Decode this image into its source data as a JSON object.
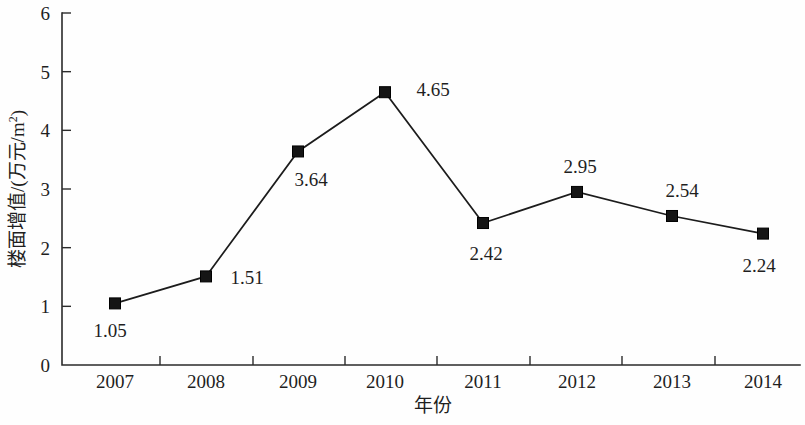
{
  "chart_data": {
    "type": "line",
    "title": "",
    "subtitle": "",
    "xlabel": "年份",
    "ylabel": "楼面增值/(万元/m²)",
    "ylabel_main": "楼面增值/(万元/m",
    "ylabel_sup": "2",
    "ylabel_tail": ")",
    "categories": [
      "2007",
      "2008",
      "2009",
      "2010",
      "2011",
      "2012",
      "2013",
      "2014"
    ],
    "values": [
      1.05,
      1.51,
      3.64,
      4.65,
      2.42,
      2.95,
      2.54,
      2.24
    ],
    "point_labels": [
      "1.05",
      "1.51",
      "3.64",
      "4.65",
      "2.42",
      "2.95",
      "2.54",
      "2.24"
    ],
    "ylim": [
      0,
      6
    ],
    "ytick_labels": [
      "0",
      "1",
      "2",
      "3",
      "4",
      "5",
      "6"
    ],
    "ytick_values": [
      0,
      1,
      2,
      3,
      4,
      5,
      6
    ],
    "grid": false,
    "legend": false,
    "legend_position": "none",
    "marker": "square",
    "series": [
      {
        "name": "楼面增值",
        "values": [
          1.05,
          1.51,
          3.64,
          4.65,
          2.42,
          2.95,
          2.54,
          2.24
        ]
      }
    ],
    "colors": {
      "line": "#1c1c1c",
      "marker": "#151515",
      "axis": "#2b2b2b",
      "text": "#1f1f1f",
      "background": "#fefefe"
    }
  },
  "layout": {
    "plot_left": 62,
    "plot_right": 800,
    "plot_top": 13,
    "plot_bottom": 365,
    "point_x": [
      115,
      206,
      298,
      385,
      483,
      577,
      672,
      763
    ],
    "tick_x": [
      160,
      253,
      345,
      437,
      530,
      622,
      715
    ],
    "label_offsets": [
      {
        "dx": -5,
        "dy": 34
      },
      {
        "dx": 41,
        "dy": 8
      },
      {
        "dx": 13,
        "dy": 35
      },
      {
        "dx": 48,
        "dy": 4
      },
      {
        "dx": 3,
        "dy": 37
      },
      {
        "dx": 3,
        "dy": -19
      },
      {
        "dx": 10,
        "dy": -19
      },
      {
        "dx": -4,
        "dy": 38
      }
    ]
  }
}
